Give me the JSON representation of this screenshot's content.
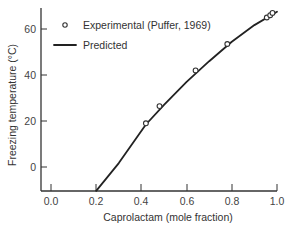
{
  "chart_data": {
    "type": "scatter+line",
    "title": "",
    "xlabel": "Caprolactam (mole fraction)",
    "ylabel": "Freezing temperature (°C)",
    "xlim": [
      0.0,
      1.0
    ],
    "ylim": [
      -10,
      70
    ],
    "x_ticks": [
      "0.0",
      "0.2",
      "0.4",
      "0.6",
      "0.8",
      "1.0"
    ],
    "y_ticks": [
      "0",
      "20",
      "40",
      "60"
    ],
    "grid": false,
    "legend_position": "upper left",
    "series": [
      {
        "name": "Experimental (Puffer, 1969)",
        "kind": "scatter",
        "marker": "open-circle",
        "x": [
          0.42,
          0.48,
          0.64,
          0.78,
          0.955,
          0.97,
          0.98
        ],
        "y": [
          19,
          26.5,
          42,
          53.5,
          65,
          66,
          67
        ]
      },
      {
        "name": "Predicted",
        "kind": "line",
        "x": [
          0.2,
          0.3,
          0.42,
          0.5,
          0.6,
          0.7,
          0.8,
          0.9,
          1.0
        ],
        "y": [
          -10.4,
          1.7,
          18.5,
          27,
          37,
          46,
          54.5,
          61.7,
          67.5
        ]
      }
    ]
  },
  "plot": {
    "px": {
      "x0": 51,
      "x1": 277,
      "y_zero": 167,
      "px_per_unit_y": 2.3,
      "axis_left": 41,
      "axis_bottom": 191,
      "axis_top": 8
    }
  },
  "legend": {
    "experimental_label": "Experimental (Puffer, 1969)",
    "predicted_label": "Predicted"
  },
  "axes": {
    "xlabel": "Caprolactam (mole fraction)",
    "ylabel": "Freezing temperature (°C)",
    "x_tick_labels": [
      "0.0",
      "0.2",
      "0.4",
      "0.6",
      "0.8",
      "1.0"
    ],
    "y_tick_labels": [
      "0",
      "20",
      "40",
      "60"
    ]
  }
}
